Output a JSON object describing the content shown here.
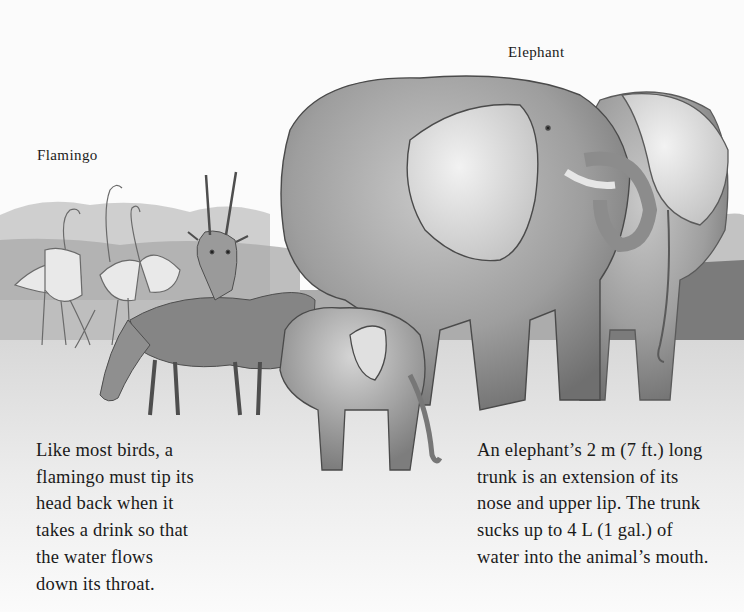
{
  "labels": {
    "elephant": "Elephant",
    "flamingo": "Flamingo"
  },
  "captions": {
    "flamingo": {
      "lines": [
        "Like most birds, a",
        "flamingo must tip its",
        "head back when it",
        "takes a drink so that",
        "the water flows",
        "down its throat."
      ]
    },
    "elephant": {
      "lines": [
        "An elephant’s 2 m (7 ft.) long",
        "trunk is an extension of its",
        "nose and upper lip. The trunk",
        "sucks up to 4 L (1 gal.) of",
        "water into the animal’s mouth."
      ]
    }
  },
  "illustration": {
    "subjects": [
      "flamingos",
      "antelopes",
      "adult elephant",
      "second elephant",
      "baby elephant"
    ],
    "style": "pencil sketch, grayscale",
    "colors": {
      "paper": "#fbfbfb",
      "ink": "#1a1a1a",
      "shade_dark": "#6e6e6e",
      "shade_mid": "#9a9a9a",
      "shade_light": "#cfcfcf"
    }
  }
}
